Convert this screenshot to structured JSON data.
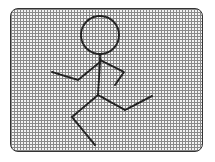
{
  "canvas": {
    "grid_cell_px": 3,
    "grid_color": "#8a8a8a",
    "background_color": "#f4f4f4",
    "border_color": "#333333"
  },
  "figure": {
    "stroke_color": "#222222",
    "head": {
      "cx": 100,
      "cy": 35,
      "r": 19
    },
    "strokes": [
      {
        "name": "torso",
        "points": "100,54 100,62 98,95"
      },
      {
        "name": "left-arm",
        "points": "100,62 78,80 52,72"
      },
      {
        "name": "right-arm",
        "points": "100,60 124,72 115,85"
      },
      {
        "name": "right-leg",
        "points": "98,95 125,110 152,96"
      },
      {
        "name": "left-leg",
        "points": "98,95 72,117 95,145"
      }
    ]
  }
}
